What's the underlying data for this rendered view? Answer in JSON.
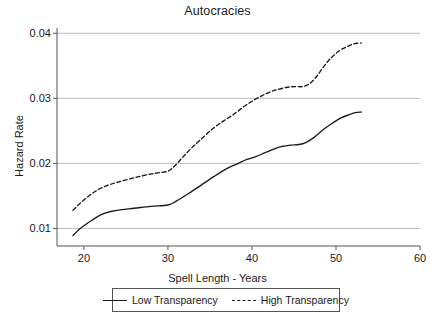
{
  "chart_data": {
    "type": "line",
    "title": "Autocracies",
    "xlabel": "Spell Length - Years",
    "ylabel": "Hazard Rate",
    "xlim": [
      16.8,
      60.0
    ],
    "ylim": [
      0.0073,
      0.0405
    ],
    "xticks": [
      20,
      30,
      40,
      50,
      60
    ],
    "xtick_labels": [
      "20",
      "30",
      "40",
      "50",
      "60"
    ],
    "yticks": [
      0.01,
      0.02,
      0.03,
      0.04
    ],
    "ytick_labels": [
      "0.01",
      "0.02",
      "0.03",
      "0.04"
    ],
    "grid": "horizontal",
    "legend_position": "below-axis",
    "line_color": "#1a1a1a",
    "grid_color": "#b4b4b4",
    "axis_color": "#555555",
    "series": [
      {
        "name": "Low Transparency",
        "style": "solid",
        "x": [
          18.7,
          19.4,
          20.2,
          21.0,
          22.0,
          23.2,
          24.5,
          26.0,
          28.0,
          30.0,
          31.0,
          32.5,
          34.0,
          35.5,
          37.0,
          38.2,
          39.4,
          40.4,
          41.5,
          42.6,
          43.6,
          44.6,
          45.6,
          46.4,
          47.4,
          48.5,
          49.6,
          50.6,
          51.6,
          52.3,
          53.0
        ],
        "y": [
          0.0089,
          0.0098,
          0.0106,
          0.0113,
          0.0121,
          0.0126,
          0.0129,
          0.0131,
          0.0134,
          0.0136,
          0.0142,
          0.0154,
          0.0167,
          0.018,
          0.0192,
          0.0199,
          0.0206,
          0.021,
          0.0216,
          0.0222,
          0.0226,
          0.0228,
          0.0229,
          0.0232,
          0.024,
          0.0252,
          0.0262,
          0.027,
          0.0275,
          0.0278,
          0.0279
        ]
      },
      {
        "name": "High Transparency",
        "style": "dashed",
        "x": [
          18.7,
          19.5,
          20.5,
          21.6,
          22.8,
          24.0,
          25.4,
          27.0,
          28.6,
          30.0,
          30.8,
          31.8,
          33.0,
          34.2,
          35.4,
          36.6,
          37.8,
          39.0,
          40.2,
          41.2,
          42.2,
          43.2,
          44.2,
          45.2,
          46.0,
          46.8,
          47.6,
          48.5,
          49.4,
          50.4,
          51.4,
          52.2,
          53.0
        ],
        "y": [
          0.0128,
          0.0138,
          0.0149,
          0.0159,
          0.0166,
          0.0171,
          0.0176,
          0.0181,
          0.0185,
          0.0188,
          0.0196,
          0.021,
          0.0226,
          0.024,
          0.0254,
          0.0265,
          0.0275,
          0.0287,
          0.0297,
          0.0304,
          0.031,
          0.0314,
          0.0317,
          0.0318,
          0.0318,
          0.0322,
          0.0332,
          0.0348,
          0.0362,
          0.0373,
          0.038,
          0.0384,
          0.0385
        ]
      }
    ]
  },
  "legend": {
    "items": [
      {
        "label": "Low Transparency",
        "style": "solid"
      },
      {
        "label": "High Transparency",
        "style": "dashed"
      }
    ]
  }
}
